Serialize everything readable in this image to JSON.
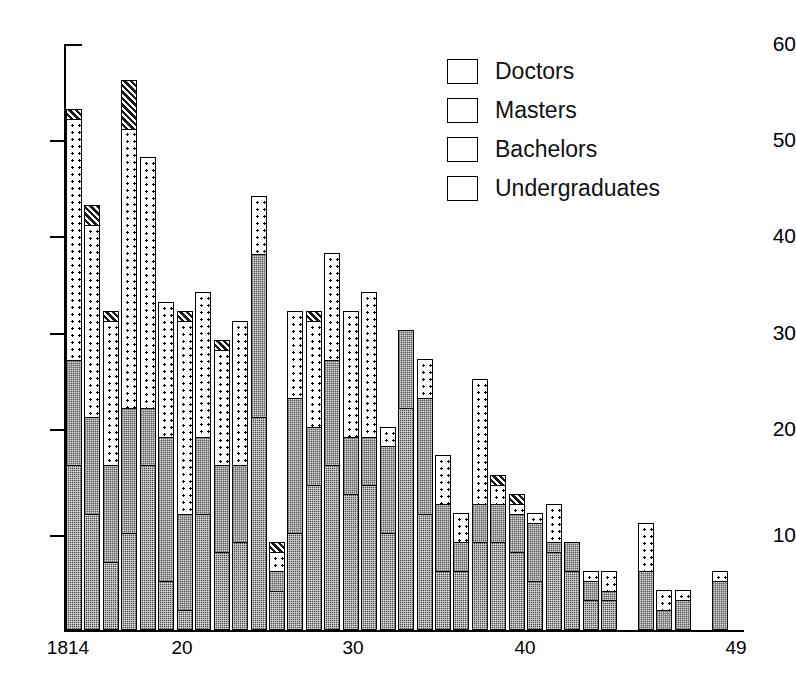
{
  "chart_data": {
    "type": "bar",
    "subtype": "stacked-bar",
    "title": "",
    "xlabel": "",
    "ylabel": "",
    "ylim": [
      0,
      60
    ],
    "yticks": [
      10,
      20,
      30,
      40,
      50,
      60
    ],
    "grid": false,
    "legend_position": "top-right",
    "x_axis_tick_labels": [
      "1814",
      "20",
      "30",
      "40",
      "49"
    ],
    "x_axis_tick_years": [
      1814,
      1820,
      1830,
      1840,
      1849
    ],
    "series": [
      {
        "name": "Undergraduates",
        "color": "#4a4a4a",
        "pattern": "dense-dark-checker",
        "values": [
          17,
          12,
          7,
          10,
          17,
          5,
          2,
          12,
          8,
          9,
          22,
          4,
          10,
          15,
          17,
          14,
          15,
          10,
          23,
          12,
          6,
          6,
          9,
          9,
          8,
          5,
          8,
          6,
          3,
          3,
          0,
          0,
          0,
          0,
          0,
          0
        ]
      },
      {
        "name": "Bachelors",
        "color": "#d9d9d9",
        "pattern": "light-stipple",
        "values": [
          11,
          10,
          10,
          13,
          6,
          15,
          10,
          8,
          9,
          8,
          17,
          2,
          14,
          6,
          11,
          6,
          5,
          9,
          8,
          12,
          7,
          3,
          4,
          4,
          4,
          6,
          1,
          3,
          2,
          1,
          0,
          6,
          2,
          3,
          0,
          5
        ]
      },
      {
        "name": "Masters",
        "color": "#ffffff",
        "pattern": "white-with-dots",
        "values": [
          25,
          20,
          15,
          29,
          26,
          14,
          20,
          15,
          12,
          15,
          6,
          2,
          9,
          11,
          11,
          13,
          15,
          2,
          0,
          4,
          5,
          3,
          13,
          2,
          1,
          1,
          4,
          0,
          1,
          2,
          0,
          5,
          2,
          1,
          0,
          1
        ]
      },
      {
        "name": "Doctors",
        "color": "#1a1a1a",
        "pattern": "diagonal-hatch",
        "values": [
          1,
          2,
          1,
          5,
          0,
          0,
          1,
          0,
          1,
          0,
          0,
          1,
          0,
          1,
          0,
          0,
          0,
          0,
          0,
          0,
          0,
          0,
          0,
          1,
          1,
          0,
          0,
          0,
          0,
          0,
          0,
          0,
          0,
          0,
          0,
          0
        ]
      }
    ],
    "bar_totals": [
      54,
      44,
      33,
      57,
      49,
      34,
      33,
      35,
      30,
      32,
      45,
      9,
      33,
      33,
      39,
      33,
      35,
      21,
      31,
      28,
      18,
      12,
      26,
      16,
      14,
      12,
      13,
      9,
      6,
      6,
      0,
      11,
      4,
      4,
      0,
      6
    ]
  },
  "legend": {
    "items": [
      {
        "label": "Doctors"
      },
      {
        "label": "Masters"
      },
      {
        "label": "Bachelors"
      },
      {
        "label": "Undergraduates"
      }
    ]
  },
  "y_axis": {
    "labels": [
      "60",
      "50",
      "40",
      "30",
      "20",
      "10"
    ]
  },
  "x_axis": {
    "labels": [
      "1814",
      "20",
      "30",
      "40",
      "49"
    ]
  }
}
